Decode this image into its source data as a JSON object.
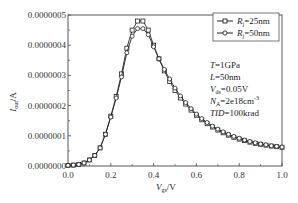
{
  "chart_data": {
    "type": "line",
    "title": "",
    "xlabel": "V_gs/V",
    "ylabel": "I_out/A",
    "xlim": [
      0.0,
      1.0
    ],
    "ylim": [
      0.0,
      5e-07
    ],
    "grid": false,
    "legend_position": "top-right",
    "x_ticks": [
      "0.0",
      "0.2",
      "0.4",
      "0.6",
      "0.8",
      "1.0"
    ],
    "y_ticks": [
      "0.0000000",
      "0.0000001",
      "0.0000002",
      "0.0000003",
      "0.0000004",
      "0.0000005"
    ],
    "x": [
      0.0,
      0.025,
      0.05,
      0.075,
      0.1,
      0.125,
      0.15,
      0.175,
      0.2,
      0.225,
      0.25,
      0.275,
      0.3,
      0.325,
      0.35,
      0.375,
      0.4,
      0.425,
      0.45,
      0.475,
      0.5,
      0.525,
      0.55,
      0.575,
      0.6,
      0.625,
      0.65,
      0.675,
      0.7,
      0.725,
      0.75,
      0.775,
      0.8,
      0.825,
      0.85,
      0.875,
      0.9,
      0.925,
      0.95,
      0.975,
      1.0
    ],
    "series": [
      {
        "name": "R_j=25nm",
        "marker": "square",
        "values": [
          2e-09,
          3e-09,
          5e-09,
          1e-08,
          2e-08,
          3.5e-08,
          6e-08,
          1.05e-07,
          1.65e-07,
          2.3e-07,
          3.05e-07,
          3.9e-07,
          4.5e-07,
          4.8e-07,
          4.8e-07,
          4.5e-07,
          4e-07,
          3.55e-07,
          3.15e-07,
          2.8e-07,
          2.5e-07,
          2.25e-07,
          2.05e-07,
          1.85e-07,
          1.68e-07,
          1.53e-07,
          1.4e-07,
          1.29e-07,
          1.19e-07,
          1.1e-07,
          1.02e-07,
          9.5e-08,
          8.9e-08,
          8.4e-08,
          7.9e-08,
          7.5e-08,
          7.2e-08,
          6.9e-08,
          6.6e-08,
          6.4e-08,
          6.2e-08
        ]
      },
      {
        "name": "R_j=50nm",
        "marker": "circle",
        "values": [
          2e-09,
          3e-09,
          5e-09,
          1e-08,
          2e-08,
          3.5e-08,
          6e-08,
          1.05e-07,
          1.62e-07,
          2.25e-07,
          2.95e-07,
          3.75e-07,
          4.3e-07,
          4.55e-07,
          4.55e-07,
          4.35e-07,
          3.95e-07,
          3.55e-07,
          3.2e-07,
          2.88e-07,
          2.58e-07,
          2.32e-07,
          2.1e-07,
          1.9e-07,
          1.72e-07,
          1.57e-07,
          1.44e-07,
          1.32e-07,
          1.22e-07,
          1.13e-07,
          1.05e-07,
          9.8e-08,
          9.2e-08,
          8.6e-08,
          8.1e-08,
          7.7e-08,
          7.3e-08,
          7e-08,
          6.7e-08,
          6.5e-08,
          6.3e-08
        ]
      }
    ],
    "annotations": [
      {
        "var": "T",
        "value": "=1GPa"
      },
      {
        "var": "L",
        "value": "=50nm"
      },
      {
        "var": "V",
        "sub": "ds",
        "value": "=0.05V"
      },
      {
        "var": "N",
        "sub": "A",
        "value": "=2e18cm",
        "sup": "-3"
      },
      {
        "var": "TID",
        "value": "=100krad"
      }
    ]
  },
  "axes": {
    "xlabel_main": "V",
    "xlabel_sub": "gs",
    "xlabel_unit": "/V",
    "ylabel_main": "I",
    "ylabel_sub": "out",
    "ylabel_unit": "/A"
  },
  "legend": {
    "items": [
      {
        "main": "R",
        "sub": "j",
        "value": "=25nm"
      },
      {
        "main": "R",
        "sub": "j",
        "value": "=50nm"
      }
    ]
  }
}
